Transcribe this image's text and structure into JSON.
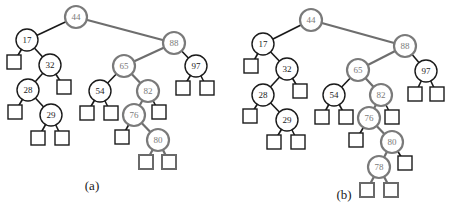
{
  "figure": {
    "caption_a": "(a)",
    "caption_b": "(b)"
  },
  "colors": {
    "black": "#1a1a1a",
    "gray": "#7a7a7a"
  },
  "trees": [
    {
      "id": "a",
      "nodes": [
        {
          "key": "44",
          "x": 76,
          "y": 17,
          "style": "gray"
        },
        {
          "key": "17",
          "x": 27,
          "y": 40,
          "style": "black"
        },
        {
          "key": "32",
          "x": 50,
          "y": 65,
          "style": "black"
        },
        {
          "key": "28",
          "x": 28,
          "y": 90,
          "style": "black"
        },
        {
          "key": "29",
          "x": 51,
          "y": 115,
          "style": "black"
        },
        {
          "key": "88",
          "x": 174,
          "y": 43,
          "style": "gray"
        },
        {
          "key": "65",
          "x": 124,
          "y": 66,
          "style": "gray"
        },
        {
          "key": "54",
          "x": 100,
          "y": 91,
          "style": "black"
        },
        {
          "key": "82",
          "x": 148,
          "y": 91,
          "style": "gray"
        },
        {
          "key": "76",
          "x": 134,
          "y": 115,
          "style": "gray"
        },
        {
          "key": "80",
          "x": 158,
          "y": 140,
          "style": "gray"
        },
        {
          "key": "97",
          "x": 196,
          "y": 66,
          "style": "black"
        }
      ],
      "edges": [
        [
          "44",
          "17",
          "black"
        ],
        [
          "44",
          "88",
          "gray"
        ],
        [
          "17",
          "L1",
          "black"
        ],
        [
          "17",
          "32",
          "black"
        ],
        [
          "32",
          "28",
          "black"
        ],
        [
          "32",
          "L2",
          "black"
        ],
        [
          "28",
          "L3",
          "black"
        ],
        [
          "28",
          "29",
          "black"
        ],
        [
          "29",
          "L4",
          "black"
        ],
        [
          "29",
          "L5",
          "black"
        ],
        [
          "88",
          "65",
          "gray"
        ],
        [
          "88",
          "97",
          "black"
        ],
        [
          "65",
          "54",
          "black"
        ],
        [
          "65",
          "82",
          "gray"
        ],
        [
          "54",
          "L6",
          "black"
        ],
        [
          "54",
          "L7",
          "black"
        ],
        [
          "82",
          "76",
          "gray"
        ],
        [
          "82",
          "L8",
          "black"
        ],
        [
          "76",
          "L9",
          "black"
        ],
        [
          "76",
          "80",
          "gray"
        ],
        [
          "80",
          "L10",
          "gray"
        ],
        [
          "80",
          "L11",
          "gray"
        ],
        [
          "97",
          "L12",
          "black"
        ],
        [
          "97",
          "L13",
          "black"
        ]
      ],
      "leaves": [
        {
          "id": "L1",
          "x": 14,
          "y": 62,
          "style": "black"
        },
        {
          "id": "L2",
          "x": 64,
          "y": 87,
          "style": "black"
        },
        {
          "id": "L3",
          "x": 15,
          "y": 112,
          "style": "black"
        },
        {
          "id": "L4",
          "x": 38,
          "y": 138,
          "style": "black"
        },
        {
          "id": "L5",
          "x": 62,
          "y": 138,
          "style": "black"
        },
        {
          "id": "L6",
          "x": 87,
          "y": 113,
          "style": "black"
        },
        {
          "id": "L7",
          "x": 111,
          "y": 113,
          "style": "black"
        },
        {
          "id": "L8",
          "x": 159,
          "y": 112,
          "style": "black"
        },
        {
          "id": "L9",
          "x": 122,
          "y": 137,
          "style": "black"
        },
        {
          "id": "L10",
          "x": 146,
          "y": 162,
          "style": "gray"
        },
        {
          "id": "L11",
          "x": 169,
          "y": 162,
          "style": "gray"
        },
        {
          "id": "L12",
          "x": 183,
          "y": 88,
          "style": "black"
        },
        {
          "id": "L13",
          "x": 207,
          "y": 88,
          "style": "black"
        }
      ],
      "caption_pos": {
        "x": 92,
        "y": 190
      }
    },
    {
      "id": "b",
      "nodes": [
        {
          "key": "44",
          "x": 311,
          "y": 20,
          "style": "gray"
        },
        {
          "key": "17",
          "x": 263,
          "y": 44,
          "style": "black"
        },
        {
          "key": "32",
          "x": 287,
          "y": 69,
          "style": "black"
        },
        {
          "key": "28",
          "x": 263,
          "y": 95,
          "style": "black"
        },
        {
          "key": "29",
          "x": 287,
          "y": 120,
          "style": "black"
        },
        {
          "key": "88",
          "x": 405,
          "y": 46,
          "style": "gray"
        },
        {
          "key": "65",
          "x": 358,
          "y": 70,
          "style": "gray"
        },
        {
          "key": "54",
          "x": 334,
          "y": 95,
          "style": "black"
        },
        {
          "key": "82",
          "x": 381,
          "y": 95,
          "style": "gray"
        },
        {
          "key": "76",
          "x": 369,
          "y": 118,
          "style": "gray"
        },
        {
          "key": "80",
          "x": 392,
          "y": 142,
          "style": "gray"
        },
        {
          "key": "78",
          "x": 379,
          "y": 167,
          "style": "gray"
        },
        {
          "key": "97",
          "x": 426,
          "y": 71,
          "style": "black"
        }
      ],
      "edges": [
        [
          "44",
          "17",
          "black"
        ],
        [
          "44",
          "88",
          "gray"
        ],
        [
          "17",
          "L1",
          "black"
        ],
        [
          "17",
          "32",
          "black"
        ],
        [
          "32",
          "28",
          "black"
        ],
        [
          "32",
          "L2",
          "black"
        ],
        [
          "28",
          "L3",
          "black"
        ],
        [
          "28",
          "29",
          "black"
        ],
        [
          "29",
          "L4",
          "black"
        ],
        [
          "29",
          "L5",
          "black"
        ],
        [
          "88",
          "65",
          "gray"
        ],
        [
          "88",
          "97",
          "black"
        ],
        [
          "65",
          "54",
          "black"
        ],
        [
          "65",
          "82",
          "gray"
        ],
        [
          "54",
          "L6",
          "black"
        ],
        [
          "54",
          "L7",
          "black"
        ],
        [
          "82",
          "76",
          "gray"
        ],
        [
          "82",
          "L8",
          "black"
        ],
        [
          "76",
          "L9",
          "black"
        ],
        [
          "76",
          "80",
          "gray"
        ],
        [
          "80",
          "78",
          "gray"
        ],
        [
          "80",
          "L10",
          "black"
        ],
        [
          "78",
          "L11",
          "gray"
        ],
        [
          "78",
          "L12",
          "gray"
        ],
        [
          "97",
          "L13",
          "black"
        ],
        [
          "97",
          "L14",
          "black"
        ]
      ],
      "leaves": [
        {
          "id": "L1",
          "x": 251,
          "y": 66,
          "style": "black"
        },
        {
          "id": "L2",
          "x": 300,
          "y": 91,
          "style": "black"
        },
        {
          "id": "L3",
          "x": 250,
          "y": 116,
          "style": "black"
        },
        {
          "id": "L4",
          "x": 274,
          "y": 142,
          "style": "black"
        },
        {
          "id": "L5",
          "x": 298,
          "y": 142,
          "style": "black"
        },
        {
          "id": "L6",
          "x": 322,
          "y": 117,
          "style": "black"
        },
        {
          "id": "L7",
          "x": 346,
          "y": 117,
          "style": "black"
        },
        {
          "id": "L8",
          "x": 392,
          "y": 117,
          "style": "black"
        },
        {
          "id": "L9",
          "x": 356,
          "y": 140,
          "style": "black"
        },
        {
          "id": "L10",
          "x": 405,
          "y": 163,
          "style": "black"
        },
        {
          "id": "L11",
          "x": 367,
          "y": 190,
          "style": "gray"
        },
        {
          "id": "L12",
          "x": 391,
          "y": 190,
          "style": "gray"
        },
        {
          "id": "L13",
          "x": 415,
          "y": 94,
          "style": "black"
        },
        {
          "id": "L14",
          "x": 437,
          "y": 94,
          "style": "black"
        }
      ],
      "caption_pos": {
        "x": 344,
        "y": 199
      }
    }
  ]
}
